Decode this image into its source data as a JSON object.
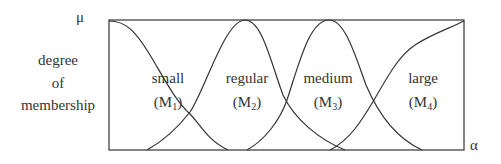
{
  "diagram": {
    "title": "",
    "y_axis": {
      "symbol": "μ",
      "label_lines": [
        "degree",
        "of",
        "membership"
      ]
    },
    "x_axis": {
      "symbol": "α"
    },
    "sets": [
      {
        "name": "small",
        "id_main": "M",
        "id_sub": "1"
      },
      {
        "name": "regular",
        "id_main": "M",
        "id_sub": "2"
      },
      {
        "name": "medium",
        "id_main": "M",
        "id_sub": "3"
      },
      {
        "name": "large",
        "id_main": "M",
        "id_sub": "4"
      }
    ],
    "colors": {
      "line": "#333333",
      "background": "#ffffff"
    }
  }
}
